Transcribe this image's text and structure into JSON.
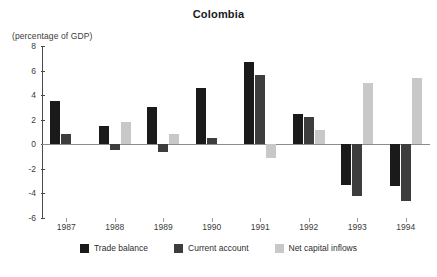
{
  "chart_data": {
    "type": "bar",
    "title": "Colombia",
    "subtitle": "(percentage of GDP)",
    "xlabel": "",
    "ylabel": "",
    "ylim": [
      -6,
      8
    ],
    "ytick_step": 2,
    "yticks": [
      8,
      6,
      4,
      2,
      0,
      -2,
      -4,
      -6
    ],
    "ytick_labels": [
      "8",
      "6",
      "4",
      "2",
      "0",
      "-2",
      "-4",
      "-6"
    ],
    "grid": false,
    "legend_position": "bottom-center",
    "categories": [
      "1987",
      "1988",
      "1989",
      "1990",
      "1991",
      "1992",
      "1993",
      "1994"
    ],
    "series": [
      {
        "name": "Trade balance",
        "color": "#1a1a1a",
        "values": [
          3.5,
          1.5,
          3.0,
          4.6,
          6.7,
          2.5,
          -3.3,
          -3.4
        ]
      },
      {
        "name": "Current account",
        "color": "#3d3d3d",
        "values": [
          0.8,
          -0.5,
          -0.6,
          0.5,
          5.6,
          2.2,
          -4.2,
          -4.6
        ]
      },
      {
        "name": "Net capital inflows",
        "color": "#c8c8c8",
        "values": [
          0.0,
          1.8,
          0.8,
          0.0,
          -1.1,
          1.2,
          5.0,
          5.4
        ]
      }
    ]
  },
  "legend": {
    "items": [
      {
        "label": "Trade balance",
        "swatch_name": "legend-swatch-trade-balance"
      },
      {
        "label": "Current account",
        "swatch_name": "legend-swatch-current-account"
      },
      {
        "label": "Net capital inflows",
        "swatch_name": "legend-swatch-net-capital-inflows"
      }
    ]
  }
}
